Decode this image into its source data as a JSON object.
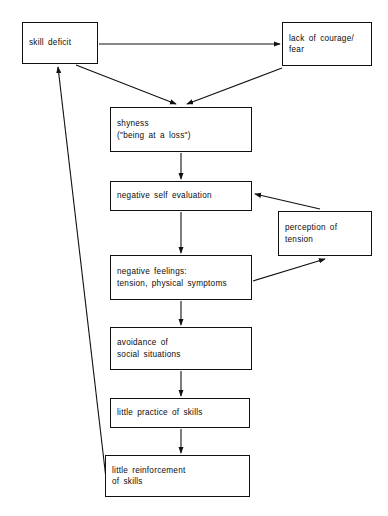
{
  "diagram": {
    "type": "flowchart",
    "background_color": "#ffffff",
    "line_color": "#111111",
    "text_color": "#0b0b0b",
    "nodes": [
      {
        "id": "skill-deficit",
        "lines": [
          "skill deficit"
        ],
        "x": 22,
        "y": 22,
        "w": 76,
        "h": 42
      },
      {
        "id": "lack-of-courage",
        "lines": [
          "lack of courage/",
          "fear"
        ],
        "x": 282,
        "y": 22,
        "w": 90,
        "h": 44
      },
      {
        "id": "shyness",
        "lines": [
          "shyness",
          "(\"being at a loss\")"
        ],
        "x": 110,
        "y": 107,
        "w": 142,
        "h": 45
      },
      {
        "id": "negative-self-evaluation",
        "lines": [
          "negative self evaluation"
        ],
        "x": 110,
        "y": 181,
        "w": 142,
        "h": 30
      },
      {
        "id": "perception-of-tension",
        "lines": [
          "perception of",
          "tension"
        ],
        "x": 278,
        "y": 211,
        "w": 94,
        "h": 45
      },
      {
        "id": "negative-feelings",
        "lines": [
          "negative feelings:",
          "tension, physical symptoms"
        ],
        "x": 110,
        "y": 255,
        "w": 142,
        "h": 45
      },
      {
        "id": "avoidance",
        "lines": [
          "avoidance of",
          "social situations"
        ],
        "x": 110,
        "y": 327,
        "w": 142,
        "h": 43
      },
      {
        "id": "little-practice",
        "lines": [
          "little practice of skills"
        ],
        "x": 110,
        "y": 398,
        "w": 140,
        "h": 30
      },
      {
        "id": "little-reinforcement",
        "lines": [
          "little reinforcement",
          "of skills"
        ],
        "x": 105,
        "y": 455,
        "w": 145,
        "h": 42
      }
    ],
    "edges": [
      {
        "id": "skill-deficit-to-lack-of-courage",
        "from": "skill-deficit",
        "to": "lack-of-courage"
      },
      {
        "id": "skill-deficit-to-shyness",
        "from": "skill-deficit",
        "to": "shyness"
      },
      {
        "id": "lack-of-courage-to-shyness",
        "from": "lack-of-courage",
        "to": "shyness"
      },
      {
        "id": "shyness-to-negative-self-evaluation",
        "from": "shyness",
        "to": "negative-self-evaluation"
      },
      {
        "id": "negative-self-evaluation-to-negative-feelings",
        "from": "negative-self-evaluation",
        "to": "negative-feelings"
      },
      {
        "id": "negative-feelings-to-perception-of-tension",
        "from": "negative-feelings",
        "to": "perception-of-tension"
      },
      {
        "id": "perception-of-tension-to-negative-self-evaluation",
        "from": "perception-of-tension",
        "to": "negative-self-evaluation"
      },
      {
        "id": "negative-feelings-to-avoidance",
        "from": "negative-feelings",
        "to": "avoidance"
      },
      {
        "id": "avoidance-to-little-practice",
        "from": "avoidance",
        "to": "little-practice"
      },
      {
        "id": "little-practice-to-little-reinforcement",
        "from": "little-practice",
        "to": "little-reinforcement"
      },
      {
        "id": "little-reinforcement-to-skill-deficit",
        "from": "little-reinforcement",
        "to": "skill-deficit"
      }
    ]
  }
}
